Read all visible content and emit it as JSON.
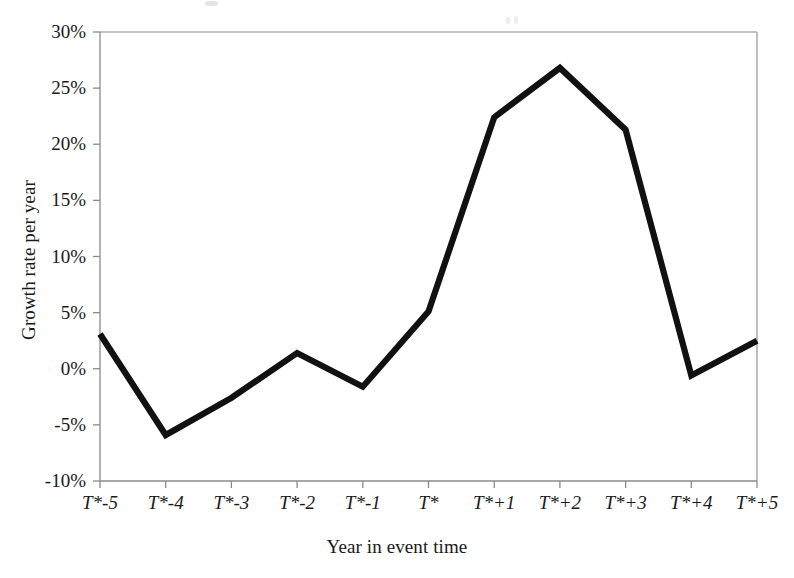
{
  "figure": {
    "name": "growth-rate-event-time-chart",
    "background": "#ffffff",
    "line_color": "#111111",
    "axis_color": "#8a8a8a"
  },
  "chart_data": {
    "type": "line",
    "title": "",
    "xlabel": "Year in event time",
    "ylabel": "Growth rate per year",
    "categories": [
      "T*-5",
      "T*-4",
      "T*-3",
      "T*-2",
      "T*-1",
      "T*",
      "T*+1",
      "T*+2",
      "T*+3",
      "T*+4",
      "T*+5"
    ],
    "values": [
      3.1,
      -5.9,
      -2.6,
      1.4,
      -1.6,
      5.1,
      22.4,
      26.8,
      21.3,
      -0.6,
      2.5
    ],
    "value_unit": "percent",
    "ylim": [
      -10,
      30
    ],
    "ytick_values": [
      -10,
      -5,
      0,
      5,
      10,
      15,
      20,
      25,
      30
    ],
    "ytick_labels": [
      "-10%",
      "-5%",
      "0%",
      "5%",
      "10%",
      "15%",
      "20%",
      "25%",
      "30%"
    ],
    "xtick_labels": [
      "T*-5",
      "T*-4",
      "T*-3",
      "T*-2",
      "T*-1",
      "T*",
      "T*+1",
      "T*+2",
      "T*+3",
      "T*+4",
      "T*+5"
    ],
    "grid": false,
    "legend": null,
    "series": [
      {
        "name": "Growth rate per year",
        "values": [
          3.1,
          -5.9,
          -2.6,
          1.4,
          -1.6,
          5.1,
          22.4,
          26.8,
          21.3,
          -0.6,
          2.5
        ]
      }
    ]
  }
}
